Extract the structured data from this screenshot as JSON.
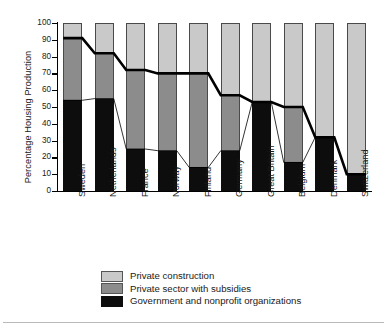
{
  "chart_data": {
    "type": "bar",
    "stacked": true,
    "title": "",
    "subtitle": "",
    "xlabel": "",
    "ylabel": "Percentage Housing Production",
    "ylim": [
      0,
      100
    ],
    "yticks": [
      0,
      10,
      20,
      30,
      40,
      50,
      60,
      70,
      80,
      90,
      100
    ],
    "ytick_labels": [
      "0",
      "10",
      "20",
      "30",
      "40",
      "50",
      "60",
      "70",
      "80",
      "90",
      "100"
    ],
    "grid": false,
    "legend_position": "bottom",
    "categories": [
      "Sweden",
      "Netherlands",
      "France",
      "Norway",
      "Finland",
      "Germany",
      "Great Britain",
      "Belgium",
      "Denmark",
      "Switzerland"
    ],
    "series": [
      {
        "name": "Government and nonprofit organizations",
        "color": "#0d0d0d",
        "values": [
          54,
          55,
          25,
          24,
          14,
          24,
          53,
          17,
          32,
          10
        ]
      },
      {
        "name": "Private sector with subsidies",
        "color": "#8c8c8c",
        "values": [
          37,
          27,
          47,
          46,
          56,
          33,
          0,
          33,
          0,
          0
        ]
      },
      {
        "name": "Private construction",
        "color": "#c9c9c9",
        "values": [
          9,
          18,
          28,
          30,
          30,
          43,
          47,
          50,
          68,
          90
        ]
      }
    ],
    "annotations": {
      "thick_line_note": "Cumulative subsidized share (government + subsidized private)",
      "thick_line_values": [
        91,
        82,
        72,
        70,
        70,
        57,
        53,
        50,
        32,
        10
      ],
      "thin_line_note": "Government and nonprofit share boundary",
      "thin_line_values": [
        54,
        55,
        25,
        24,
        14,
        24,
        53,
        17,
        32,
        10
      ]
    }
  },
  "legend": {
    "items": [
      {
        "label": "Private construction",
        "swatch": "light"
      },
      {
        "label": "Private sector with subsidies",
        "swatch": "mid"
      },
      {
        "label": "Government and nonprofit organizations",
        "swatch": "dark"
      }
    ]
  }
}
